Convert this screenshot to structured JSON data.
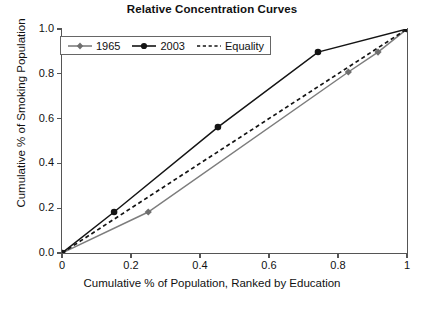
{
  "chart_data": {
    "type": "line",
    "title": "Relative Concentration Curves",
    "xlabel": "Cumulative % of Population, Ranked by Education",
    "ylabel": "Cumulative % of Smoking Population",
    "xlim": [
      0,
      1
    ],
    "ylim": [
      0,
      1
    ],
    "xticks": [
      "0",
      "0.2",
      "0.4",
      "0.6",
      "0.8",
      "1"
    ],
    "xtick_values": [
      0,
      0.2,
      0.4,
      0.6,
      0.8,
      1
    ],
    "yticks": [
      "0.0",
      "0.2",
      "0.4",
      "0.6",
      "0.8",
      "1.0"
    ],
    "ytick_values": [
      0,
      0.2,
      0.4,
      0.6,
      0.8,
      1
    ],
    "grid": false,
    "legend_position": "upper left",
    "series": [
      {
        "name": "1965",
        "color": "#7d7d7d",
        "marker": "diamond",
        "linestyle": "solid",
        "points": [
          {
            "x": 0,
            "y": 0
          },
          {
            "x": 0.25,
            "y": 0.183
          },
          {
            "x": 0.83,
            "y": 0.808
          },
          {
            "x": 0.916,
            "y": 0.897
          },
          {
            "x": 1,
            "y": 1
          }
        ]
      },
      {
        "name": "2003",
        "color": "#141414",
        "marker": "circle",
        "linestyle": "solid",
        "points": [
          {
            "x": 0,
            "y": 0
          },
          {
            "x": 0.151,
            "y": 0.183
          },
          {
            "x": 0.452,
            "y": 0.562
          },
          {
            "x": 0.742,
            "y": 0.897
          },
          {
            "x": 1,
            "y": 1
          }
        ]
      },
      {
        "name": "Equality",
        "color": "#141414",
        "marker": "none",
        "linestyle": "dashed",
        "points": [
          {
            "x": 0,
            "y": 0
          },
          {
            "x": 1,
            "y": 1
          }
        ]
      }
    ]
  },
  "legend": {
    "items": [
      {
        "label": "1965"
      },
      {
        "label": "2003"
      },
      {
        "label": "Equality"
      }
    ]
  }
}
